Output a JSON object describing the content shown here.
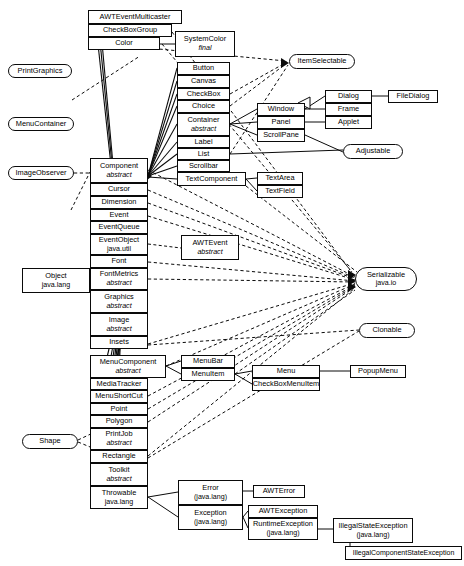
{
  "diagram": {
    "kind": "uml-class-diagram",
    "colors": {
      "stroke": "#0a0a0a",
      "fill": "#ffffff",
      "text": "#000000"
    },
    "legend": {
      "solid_line": "extends (inheritance)",
      "dashed_line": "implements (interface realization)"
    },
    "classes": [
      {
        "id": "awteventmulticaster",
        "name": "AWTEventMulticaster"
      },
      {
        "id": "checkboxgroup",
        "name": "CheckBoxGroup"
      },
      {
        "id": "color",
        "name": "Color"
      },
      {
        "id": "systemcolor",
        "name": "SystemColor",
        "modifier": "final"
      },
      {
        "id": "button",
        "name": "Button"
      },
      {
        "id": "canvas",
        "name": "Canvas"
      },
      {
        "id": "checkbox",
        "name": "CheckBox"
      },
      {
        "id": "choice",
        "name": "Choice"
      },
      {
        "id": "container",
        "name": "Container",
        "modifier": "abstract"
      },
      {
        "id": "label",
        "name": "Label"
      },
      {
        "id": "list",
        "name": "List"
      },
      {
        "id": "scrollbar",
        "name": "Scrollbar"
      },
      {
        "id": "textcomponent",
        "name": "TextComponent"
      },
      {
        "id": "window",
        "name": "Window"
      },
      {
        "id": "panel",
        "name": "Panel"
      },
      {
        "id": "scrollpane",
        "name": "ScrollPane"
      },
      {
        "id": "dialog",
        "name": "Dialog"
      },
      {
        "id": "frame",
        "name": "Frame"
      },
      {
        "id": "applet",
        "name": "Applet"
      },
      {
        "id": "filedialog",
        "name": "FileDialog"
      },
      {
        "id": "textarea",
        "name": "TextArea"
      },
      {
        "id": "textfield",
        "name": "TextField"
      },
      {
        "id": "component",
        "name": "Component",
        "modifier": "abstract"
      },
      {
        "id": "cursor",
        "name": "Cursor"
      },
      {
        "id": "dimension",
        "name": "Dimension"
      },
      {
        "id": "event",
        "name": "Event"
      },
      {
        "id": "eventqueue",
        "name": "EventQueue"
      },
      {
        "id": "eventobject",
        "name": "EventObject",
        "package": "java.util"
      },
      {
        "id": "font",
        "name": "Font"
      },
      {
        "id": "fontmetrics",
        "name": "FontMetrics",
        "modifier": "abstract"
      },
      {
        "id": "graphics",
        "name": "Graphics",
        "modifier": "abstract"
      },
      {
        "id": "image",
        "name": "Image",
        "modifier": "abstract"
      },
      {
        "id": "insets",
        "name": "Insets"
      },
      {
        "id": "menucomponent",
        "name": "MenuComponent",
        "modifier": "abstract"
      },
      {
        "id": "mediatracker",
        "name": "MediaTracker"
      },
      {
        "id": "menushortcut",
        "name": "MenuShortCut"
      },
      {
        "id": "point",
        "name": "Point"
      },
      {
        "id": "polygon",
        "name": "Polygon"
      },
      {
        "id": "printjob",
        "name": "PrintJob",
        "modifier": "abstract"
      },
      {
        "id": "rectangle",
        "name": "Rectangle"
      },
      {
        "id": "toolkit",
        "name": "Toolkit",
        "modifier": "abstract"
      },
      {
        "id": "throwable",
        "name": "Throwable",
        "package": "java.lang"
      },
      {
        "id": "awtevent",
        "name": "AWTEvent",
        "modifier": "abstract"
      },
      {
        "id": "object",
        "name": "Object",
        "package": "java.lang"
      },
      {
        "id": "menubar",
        "name": "MenuBar"
      },
      {
        "id": "menuitem",
        "name": "MenuItem"
      },
      {
        "id": "menu",
        "name": "Menu"
      },
      {
        "id": "checkboxmenuitem",
        "name": "CheckBoxMenuItem"
      },
      {
        "id": "popupmenu",
        "name": "PopupMenu"
      },
      {
        "id": "error",
        "name": "Error",
        "package": "(java.lang)"
      },
      {
        "id": "exception",
        "name": "Exception",
        "package": "(java.lang)"
      },
      {
        "id": "awterror",
        "name": "AWTError"
      },
      {
        "id": "awtexception",
        "name": "AWTException"
      },
      {
        "id": "runtimeexception",
        "name": "RuntimeException",
        "package": "(java.lang)"
      },
      {
        "id": "illegalstateexception",
        "name": "IllegalStateException",
        "package": "(java.lang)"
      },
      {
        "id": "illegalcomponentstateexception",
        "name": "IllegalComponentStateException"
      }
    ],
    "interfaces": [
      {
        "id": "printgraphics",
        "name": "PrintGraphics"
      },
      {
        "id": "menucontainer",
        "name": "MenuContainer"
      },
      {
        "id": "imageobserver",
        "name": "ImageObserver"
      },
      {
        "id": "itemselectable",
        "name": "ItemSelectable"
      },
      {
        "id": "adjustable",
        "name": "Adjustable"
      },
      {
        "id": "serializable",
        "name": "Serializable",
        "package": "java.io"
      },
      {
        "id": "clonable",
        "name": "Clonable"
      },
      {
        "id": "shape",
        "name": "Shape"
      }
    ]
  }
}
